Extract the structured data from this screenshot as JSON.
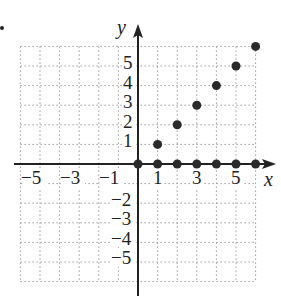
{
  "chart_data": {
    "type": "scatter",
    "title": "",
    "xlabel": "x",
    "ylabel": "y",
    "xlim": [
      -6,
      6
    ],
    "ylim": [
      -6,
      6
    ],
    "grid": true,
    "grid_style": "dotted",
    "x_tick_labels": [
      "-5",
      "-3",
      "-1",
      "1",
      "3",
      "5"
    ],
    "y_tick_labels": [
      "5",
      "4",
      "3",
      "2",
      "1",
      "-2",
      "-3",
      "-4",
      "-5"
    ],
    "series": [
      {
        "name": "points",
        "points": [
          [
            0,
            0
          ],
          [
            1,
            0
          ],
          [
            2,
            0
          ],
          [
            3,
            0
          ],
          [
            4,
            0
          ],
          [
            5,
            0
          ],
          [
            6,
            0
          ],
          [
            1,
            1
          ],
          [
            2,
            2
          ],
          [
            3,
            3
          ],
          [
            4,
            4
          ],
          [
            5,
            5
          ],
          [
            6,
            6
          ]
        ]
      }
    ],
    "colors": {
      "axis": "#222222",
      "grid": "#9a9a9a",
      "point": "#2a2a2a"
    }
  },
  "labels": {
    "x_axis": "x",
    "y_axis": "y",
    "xt": {
      "m5": "−5",
      "m3": "−3",
      "m1": "−1",
      "p1": "1",
      "p3": "3",
      "p5": "5"
    },
    "yt": {
      "p5": "5",
      "p4": "4",
      "p3": "3",
      "p2": "2",
      "p1": "1",
      "m2": "−2",
      "m3": "−3",
      "m4": "−4",
      "m5": "−5"
    }
  }
}
